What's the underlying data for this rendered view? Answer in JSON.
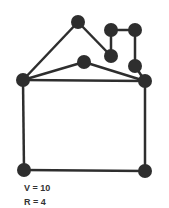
{
  "graph": {
    "colors": {
      "edge": "#2e2e2e",
      "node": "#2e2e2e",
      "text": "#333333"
    },
    "nodes": [
      {
        "id": "top",
        "x": 78,
        "y": 22
      },
      {
        "id": "ur1",
        "x": 111,
        "y": 30
      },
      {
        "id": "ur2",
        "x": 135,
        "y": 30
      },
      {
        "id": "mr1",
        "x": 111,
        "y": 56
      },
      {
        "id": "mr2",
        "x": 135,
        "y": 66
      },
      {
        "id": "mid",
        "x": 84,
        "y": 62
      },
      {
        "id": "left",
        "x": 23,
        "y": 80
      },
      {
        "id": "right",
        "x": 145,
        "y": 81
      },
      {
        "id": "bl",
        "x": 24,
        "y": 170
      },
      {
        "id": "br",
        "x": 145,
        "y": 171
      }
    ],
    "edges": [
      [
        "left",
        "top"
      ],
      [
        "top",
        "mr1"
      ],
      [
        "mr1",
        "ur1"
      ],
      [
        "ur1",
        "ur2"
      ],
      [
        "ur2",
        "mr2"
      ],
      [
        "mr2",
        "right"
      ],
      [
        "left",
        "mid"
      ],
      [
        "mid",
        "right"
      ],
      [
        "left",
        "right"
      ],
      [
        "left",
        "bl"
      ],
      [
        "bl",
        "br"
      ],
      [
        "br",
        "right"
      ]
    ]
  },
  "labels": {
    "vertices": "V = 10",
    "regions": "R = 4"
  }
}
